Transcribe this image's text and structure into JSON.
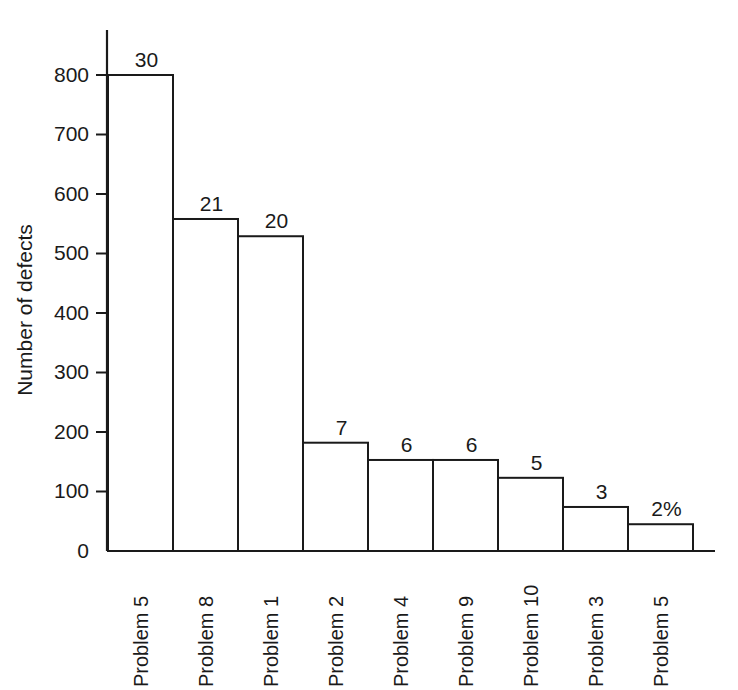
{
  "chart_data": {
    "type": "bar",
    "title": "",
    "subtitle": "",
    "xlabel": "",
    "ylabel": "Number of defects",
    "ylim": [
      0,
      870
    ],
    "ytick_values": [
      0,
      100,
      200,
      300,
      400,
      500,
      600,
      700,
      800
    ],
    "ytick_labels": [
      "0",
      "100",
      "200",
      "300",
      "400",
      "500",
      "600",
      "700",
      "800"
    ],
    "grid": false,
    "legend": null,
    "legend_position": "none",
    "bar_style": "unfilled-outline",
    "categories": [
      "Problem 5",
      "Problem 8",
      "Problem 1",
      "Problem 2",
      "Problem 4",
      "Problem 9",
      "Problem 10",
      "Problem 3",
      "Problem 5"
    ],
    "values": [
      800,
      558,
      529,
      182,
      153,
      153,
      123,
      74,
      45
    ],
    "data_labels": [
      "30",
      "21",
      "20",
      "7",
      "6",
      "6",
      "5",
      "3",
      "2%"
    ],
    "annotations": [
      "Data labels above bars are percent-of-total shares; the last one carries the % sign."
    ],
    "colors": {
      "bar_fill": "#ffffff",
      "bar_stroke": "#1a1a1a",
      "axis": "#1a1a1a",
      "text": "#1a1a1a",
      "background": "#ffffff"
    }
  },
  "layout": {
    "axis_x": 107,
    "axis_top_y": 30,
    "baseline_y": 551,
    "value_800_y": 75,
    "plot_left": 108,
    "bar_width": 65,
    "bar_gap": 0,
    "axis_right_x": 715,
    "tick_length": 11,
    "cat_label_start_y": 561,
    "ylabel_x": 32,
    "ylabel_y": 310
  }
}
